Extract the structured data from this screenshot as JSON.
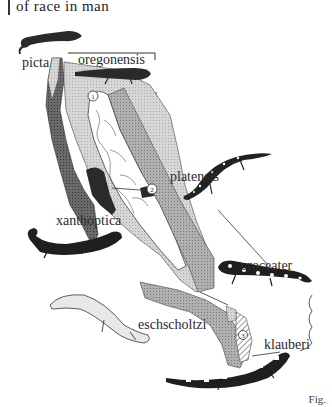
{
  "header": {
    "caption_fragment": "of race in man"
  },
  "figure": {
    "labels": {
      "picta": "picta",
      "oregonensis": "oregonensis",
      "platensis": "platensis",
      "xanthoptica": "xanthoptica",
      "croceater": "croceater",
      "eschscholtzi": "eschscholtzi",
      "klauberi": "klauberi"
    },
    "markers": [
      "1",
      "2",
      "3"
    ],
    "fig_mark": "Fig."
  },
  "colors": {
    "ink": "#222222",
    "dark_stipple": "#555555",
    "medium_stipple": "#9a9a9a",
    "light_stipple": "#c8c8c8",
    "valley": "#ffffff"
  }
}
